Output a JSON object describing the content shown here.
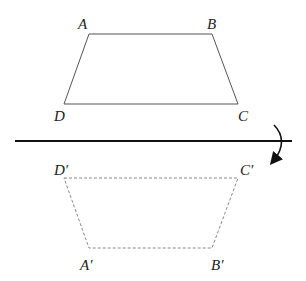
{
  "diagram": {
    "type": "reflection",
    "original": {
      "labels": {
        "A": "A",
        "B": "B",
        "C": "C",
        "D": "D"
      },
      "points": {
        "A": [
          89,
          34
        ],
        "B": [
          212,
          34
        ],
        "C": [
          238,
          104
        ],
        "D": [
          64,
          104
        ]
      },
      "stroke": "#555555",
      "style": "solid"
    },
    "image": {
      "labels": {
        "A": "A′",
        "B": "B′",
        "C": "C′",
        "D": "D′"
      },
      "points": {
        "A": [
          89,
          248
        ],
        "B": [
          212,
          248
        ],
        "C": [
          238,
          178
        ],
        "D": [
          64,
          178
        ]
      },
      "stroke": "#888888",
      "style": "dashed"
    },
    "axis": {
      "y": 141,
      "x1": 15,
      "x2": 292,
      "stroke": "#111111"
    },
    "rotation_arrow": {
      "direction": "clockwise-down"
    }
  }
}
